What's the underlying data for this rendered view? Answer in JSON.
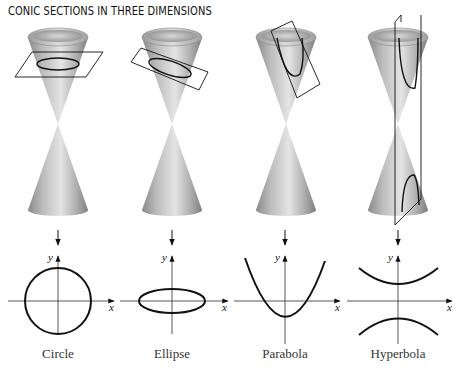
{
  "title": "CONIC SECTIONS IN THREE DIMENSIONS",
  "colors": {
    "cone_light": "#e2e2e2",
    "cone_mid": "#b4b4b4",
    "cone_dark": "#7a7a7a",
    "line": "#111111",
    "label": "#333333"
  },
  "panels": [
    {
      "name": "circle",
      "label": "Circle",
      "axis_x": "x",
      "axis_y": "y"
    },
    {
      "name": "ellipse",
      "label": "Ellipse",
      "axis_x": "x",
      "axis_y": "y"
    },
    {
      "name": "parabola",
      "label": "Parabola",
      "axis_x": "x",
      "axis_y": "y"
    },
    {
      "name": "hyperbola",
      "label": "Hyperbola",
      "axis_x": "x",
      "axis_y": "y"
    }
  ]
}
